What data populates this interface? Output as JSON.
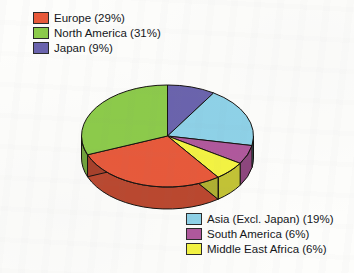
{
  "chart_data": {
    "type": "pie",
    "title": "",
    "subtitle": "",
    "xlabel": "",
    "ylabel": "",
    "three_d": true,
    "legend_position": "split-top-left-and-bottom-right",
    "grid": false,
    "categories": [
      "Europe",
      "North America",
      "Japan",
      "Asia (Excl. Japan)",
      "South America",
      "Middle East Africa"
    ],
    "values": [
      29,
      31,
      9,
      19,
      6,
      6
    ],
    "unit": "%",
    "colors": [
      "#e8593a",
      "#8ccb4a",
      "#6a63ad",
      "#8ed2e8",
      "#b0589c",
      "#f4f442"
    ],
    "slices": [
      {
        "label": "Europe",
        "value": 29,
        "display": "Europe (29%)",
        "color": "#e8593a"
      },
      {
        "label": "North America",
        "value": 31,
        "display": "North America (31%)",
        "color": "#8ccb4a"
      },
      {
        "label": "Japan",
        "value": 9,
        "display": "Japan (9%)",
        "color": "#6a63ad"
      },
      {
        "label": "Asia (Excl. Japan)",
        "value": 19,
        "display": "Asia (Excl. Japan) (19%)",
        "color": "#8ed2e8"
      },
      {
        "label": "South America",
        "value": 6,
        "display": "South America (6%)",
        "color": "#b0589c"
      },
      {
        "label": "Middle East Africa",
        "value": 6,
        "display": "Middle East Africa (6%)",
        "color": "#f4f442"
      }
    ]
  },
  "legend_top": {
    "items": [
      {
        "label": "Europe (29%)",
        "color": "#e8593a"
      },
      {
        "label": "North America (31%)",
        "color": "#8ccb4a"
      },
      {
        "label": "Japan (9%)",
        "color": "#6a63ad"
      }
    ]
  },
  "legend_bottom": {
    "items": [
      {
        "label": "Asia (Excl. Japan) (19%)",
        "color": "#8ed2e8"
      },
      {
        "label": "South America (6%)",
        "color": "#b0589c"
      },
      {
        "label": "Middle East Africa (6%)",
        "color": "#f4f442"
      }
    ]
  }
}
